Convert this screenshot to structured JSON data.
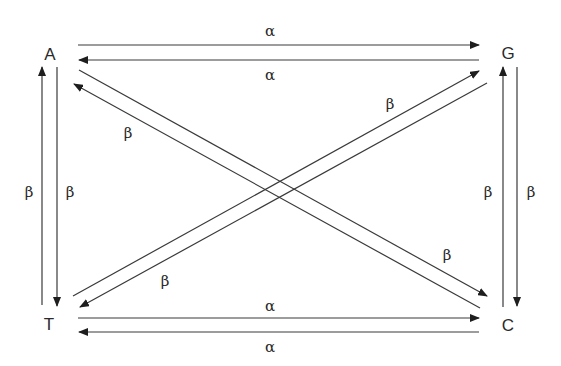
{
  "diagram": {
    "nodes": [
      {
        "id": "A",
        "label": "A",
        "x": 50,
        "y": 54
      },
      {
        "id": "G",
        "label": "G",
        "x": 508,
        "y": 53
      },
      {
        "id": "T",
        "label": "T",
        "x": 49,
        "y": 324
      },
      {
        "id": "C",
        "label": "C",
        "x": 508,
        "y": 325
      }
    ],
    "edges": [
      {
        "from": "A",
        "to": "G",
        "label": "α",
        "label_x": 270,
        "label_y": 31
      },
      {
        "from": "G",
        "to": "A",
        "label": "α",
        "label_x": 270,
        "label_y": 75
      },
      {
        "from": "T",
        "to": "C",
        "label": "α",
        "label_x": 270,
        "label_y": 306
      },
      {
        "from": "C",
        "to": "T",
        "label": "α",
        "label_x": 270,
        "label_y": 347
      },
      {
        "from": "T",
        "to": "A",
        "label": "β",
        "label_x": 29,
        "label_y": 192
      },
      {
        "from": "A",
        "to": "T",
        "label": "β",
        "label_x": 70,
        "label_y": 192
      },
      {
        "from": "C",
        "to": "G",
        "label": "β",
        "label_x": 488,
        "label_y": 192
      },
      {
        "from": "G",
        "to": "C",
        "label": "β",
        "label_x": 531,
        "label_y": 192
      },
      {
        "from": "C",
        "to": "A",
        "label": "β",
        "label_x": 128,
        "label_y": 133
      },
      {
        "from": "A",
        "to": "C",
        "label": "β",
        "label_x": 447,
        "label_y": 255
      },
      {
        "from": "T",
        "to": "G",
        "label": "β",
        "label_x": 390,
        "label_y": 104
      },
      {
        "from": "G",
        "to": "T",
        "label": "β",
        "label_x": 165,
        "label_y": 281
      }
    ]
  }
}
